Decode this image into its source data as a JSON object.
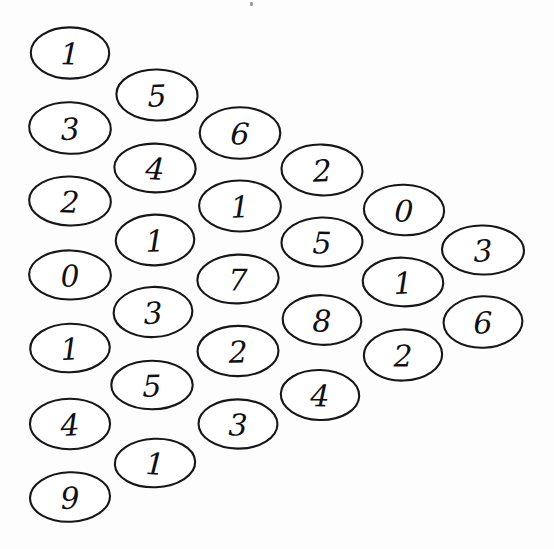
{
  "figure": {
    "background_color": "#fdfdfd",
    "stroke_color": "#16161a",
    "digit_color": "#101014",
    "ellipse_rx": 40,
    "ellipse_ry": 25,
    "total_cells": 28,
    "rows": 7
  },
  "artifact": {
    "speck_x": 250,
    "speck_y": 2
  },
  "cells": [
    {
      "value": "1",
      "cx": 70,
      "cy": 53,
      "row": 0,
      "col": 0
    },
    {
      "value": "5",
      "cx": 157,
      "cy": 95,
      "row": 0,
      "col": 1
    },
    {
      "value": "6",
      "cx": 240,
      "cy": 133,
      "row": 0,
      "col": 2
    },
    {
      "value": "2",
      "cx": 322,
      "cy": 170,
      "row": 0,
      "col": 3
    },
    {
      "value": "0",
      "cx": 404,
      "cy": 210,
      "row": 0,
      "col": 4
    },
    {
      "value": "3",
      "cx": 483,
      "cy": 250,
      "row": 0,
      "col": 5
    },
    {
      "value": "3",
      "cx": 70,
      "cy": 128,
      "row": 1,
      "col": 0
    },
    {
      "value": "4",
      "cx": 155,
      "cy": 168,
      "row": 1,
      "col": 1
    },
    {
      "value": "1",
      "cx": 240,
      "cy": 206,
      "row": 1,
      "col": 2
    },
    {
      "value": "5",
      "cx": 322,
      "cy": 242,
      "row": 1,
      "col": 3
    },
    {
      "value": "1",
      "cx": 403,
      "cy": 282,
      "row": 1,
      "col": 4
    },
    {
      "value": "6",
      "cx": 483,
      "cy": 322,
      "row": 1,
      "col": 5
    },
    {
      "value": "2",
      "cx": 70,
      "cy": 201,
      "row": 2,
      "col": 0
    },
    {
      "value": "1",
      "cx": 155,
      "cy": 240,
      "row": 2,
      "col": 1
    },
    {
      "value": "7",
      "cx": 238,
      "cy": 279,
      "row": 2,
      "col": 2
    },
    {
      "value": "8",
      "cx": 322,
      "cy": 320,
      "row": 2,
      "col": 3
    },
    {
      "value": "2",
      "cx": 403,
      "cy": 355,
      "row": 2,
      "col": 4
    },
    {
      "value": "0",
      "cx": 70,
      "cy": 275,
      "row": 3,
      "col": 0
    },
    {
      "value": "3",
      "cx": 153,
      "cy": 312,
      "row": 3,
      "col": 1
    },
    {
      "value": "2",
      "cx": 238,
      "cy": 351,
      "row": 3,
      "col": 2
    },
    {
      "value": "4",
      "cx": 320,
      "cy": 395,
      "row": 3,
      "col": 3
    },
    {
      "value": "1",
      "cx": 70,
      "cy": 348,
      "row": 4,
      "col": 0
    },
    {
      "value": "5",
      "cx": 152,
      "cy": 385,
      "row": 4,
      "col": 1
    },
    {
      "value": "3",
      "cx": 238,
      "cy": 424,
      "row": 4,
      "col": 2
    },
    {
      "value": "4",
      "cx": 70,
      "cy": 424,
      "row": 5,
      "col": 0
    },
    {
      "value": "1",
      "cx": 155,
      "cy": 463,
      "row": 5,
      "col": 1
    },
    {
      "value": "9",
      "cx": 70,
      "cy": 497,
      "row": 6,
      "col": 0
    }
  ]
}
